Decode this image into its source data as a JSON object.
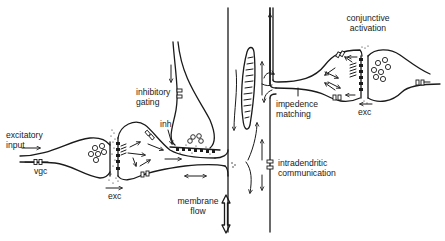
{
  "diagram": {
    "type": "neuron-synapse schematic",
    "labels": {
      "excitatory_input": [
        "excitatory",
        "input"
      ],
      "vgc": "vgc",
      "exc_left": "exc",
      "inhibitory_gating": [
        "inhibitory",
        "gating"
      ],
      "inh": "inh",
      "membrane_flow": [
        "membrane",
        "flow"
      ],
      "intradendritic_communication": [
        "intradendritic",
        "communication"
      ],
      "impedence_matching": [
        "impedence",
        "matching"
      ],
      "conjunctive_activation": [
        "conjunctive",
        "activation"
      ],
      "exc_right": "exc"
    },
    "colors": {
      "ink": "#1a1a1a",
      "background": "#ffffff"
    }
  }
}
